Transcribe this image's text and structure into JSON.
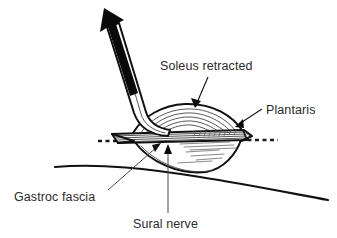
{
  "figure": {
    "kind": "anatomical-surgical-diagram",
    "background_color": "#ffffff",
    "ink_color": "#111111",
    "text_color": "#2b2b2b",
    "width": 337,
    "height": 238
  },
  "labels": {
    "soleus": "Soleus retracted",
    "plantaris": "Plantaris",
    "gastroc_fascia": "Gastroc fascia",
    "sural_nerve": "Sural nerve"
  },
  "icons": {
    "retraction_arrow": "bold-up-left-arrow-icon",
    "soleus_leader": "leader-arrow-icon",
    "plantaris_leader": "leader-arrow-icon",
    "gastroc_leader": "leader-arrow-icon",
    "sural_leader": "leader-arrow-icon"
  },
  "structures": {
    "retractor": "surgical-retractor-blade",
    "soleus_belly": "soleus-muscle-belly",
    "fascia_bands": "gastroc-fascia-striations",
    "incision_line": "dashed-incision-line",
    "leg_contour": "posterior-calf-contour"
  }
}
